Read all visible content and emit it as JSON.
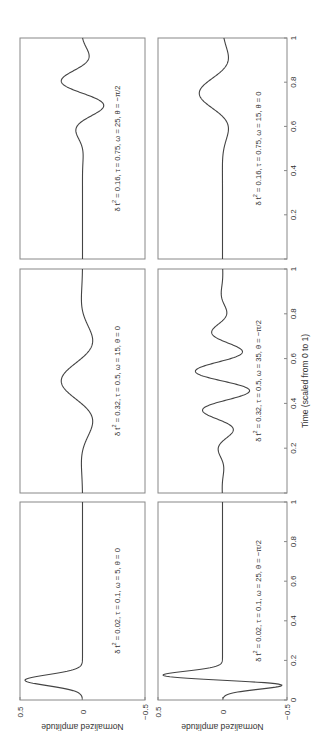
{
  "figure": {
    "orientation": "rotated-90-ccw",
    "line_color": "#444444",
    "frame_color": "#888888",
    "xlabel": "Time (scaled from 0 to 1)",
    "ylabel": "Normalized amplitude"
  },
  "chart_data": [
    {
      "type": "line",
      "panel": "row1-col1",
      "title": "δ t² = 0.02, τ = 0.1, ω = 5, θ = 0",
      "params": {
        "dt2": 0.02,
        "tau": 0.1,
        "omega": 5,
        "theta": "0"
      },
      "xlabel": "",
      "ylabel": "Normalized amplitude",
      "xlim": [
        0,
        1
      ],
      "ylim": [
        -0.5,
        0.5
      ],
      "xticks": [],
      "yticks": [
        "0.5",
        "0",
        "-0.5"
      ],
      "description": "single positive spike of ~0.45 at t≈0.1, flat at 0 elsewhere"
    },
    {
      "type": "line",
      "panel": "row1-col2",
      "title": "δ t² = 0.32, τ = 0.5, ω = 15, θ = 0",
      "params": {
        "dt2": 0.32,
        "tau": 0.5,
        "omega": 15,
        "theta": "0"
      },
      "xlabel": "",
      "ylabel": "",
      "xlim": [
        0,
        1
      ],
      "ylim": [
        -0.5,
        0.5
      ],
      "xticks": [],
      "yticks": [],
      "description": "smooth oscillation centered at t=0.5, peak ≈ 0.15, troughs ≈ -0.1 near t≈0.3 and 0.7"
    },
    {
      "type": "line",
      "panel": "row1-col3",
      "title": "δ t² = 0.16, τ = 0.75, ω = 25, θ = −π/2",
      "params": {
        "dt2": 0.16,
        "tau": 0.75,
        "omega": 25,
        "theta": "-π/2"
      },
      "xlabel": "",
      "ylabel": "",
      "xlim": [
        0,
        1
      ],
      "ylim": [
        -0.5,
        0.5
      ],
      "xticks": [],
      "yticks": [],
      "description": "flat until t≈0.5, then sine-like oscillation: trough ≈ -0.15 at t≈0.66, peak ≈ +0.15 at t≈0.84"
    },
    {
      "type": "line",
      "panel": "row2-col1",
      "title": "δ t² = 0.02, τ = 0.1, ω = 25, θ = −π/2",
      "params": {
        "dt2": 0.02,
        "tau": 0.1,
        "omega": 25,
        "theta": "-π/2"
      },
      "xlabel": "",
      "ylabel": "Normalized amplitude",
      "xlim": [
        0,
        1
      ],
      "ylim": [
        -0.5,
        0.5
      ],
      "xticks": [
        "0",
        "0.2",
        "0.4",
        "0.6",
        "0.8",
        "1"
      ],
      "yticks": [
        "0.5",
        "0",
        "-0.5"
      ],
      "description": "biphasic spike: negative ≈ -0.35 at t≈0.07, positive ≈ +0.42 at t≈0.12, flat after"
    },
    {
      "type": "line",
      "panel": "row2-col2",
      "title": "δ t² = 0.32, τ = 0.5, ω = 35, θ = −π/2",
      "params": {
        "dt2": 0.32,
        "tau": 0.5,
        "omega": 35,
        "theta": "-π/2"
      },
      "xlabel": "Time (scaled from 0 to 1)",
      "ylabel": "",
      "xlim": [
        0,
        1
      ],
      "ylim": [
        -0.5,
        0.5
      ],
      "xticks": [
        "0",
        "0.2",
        "0.4",
        "0.6",
        "0.8",
        "1"
      ],
      "yticks": [],
      "description": "windowed sine oscillation centered at t=0.5, ~5 cycles, peak amplitude ≈ 0.2"
    },
    {
      "type": "line",
      "panel": "row2-col3",
      "title": "δ t² = 0.16, τ = 0.75, ω = 15, θ = 0",
      "params": {
        "dt2": 0.16,
        "tau": 0.75,
        "omega": 15,
        "theta": "0"
      },
      "xlabel": "",
      "ylabel": "",
      "xlim": [
        0,
        1
      ],
      "ylim": [
        -0.5,
        0.5
      ],
      "xticks": [
        "0",
        "0.2",
        "0.4",
        "0.6",
        "0.8",
        "1"
      ],
      "yticks": [],
      "description": "flat until t≈0.5, dip ≈ -0.05 at t≈0.58, peak ≈ +0.18 at t≈0.75, dip ≈ -0.05 at t≈0.92"
    }
  ],
  "panels": [
    {
      "col": 0,
      "row": 0,
      "tau": 0.1,
      "omega": 5,
      "theta": 0,
      "width": 0.028,
      "amp": 0.46,
      "label_main": "δ t",
      "label_rest": " = 0.02, τ = 0.1, ω = 5, θ = 0"
    },
    {
      "col": 1,
      "row": 0,
      "tau": 0.5,
      "omega": 15,
      "theta": 0,
      "width": 0.16,
      "amp": 0.17,
      "label_main": "δ t",
      "label_rest": " = 0.32, τ = 0.5, ω = 15, θ = 0"
    },
    {
      "col": 2,
      "row": 0,
      "tau": 0.75,
      "omega": 25,
      "theta": -1.5708,
      "width": 0.11,
      "amp": 0.17,
      "label_main": "δ t",
      "label_rest": " = 0.16, τ = 0.75, ω = 25, θ = −π/2"
    },
    {
      "col": 0,
      "row": 1,
      "tau": 0.1,
      "omega": 25,
      "theta": -1.5708,
      "width": 0.028,
      "amp": 0.46,
      "label_main": "δ t",
      "label_rest": " = 0.02, τ = 0.1, ω = 25, θ = −π/2"
    },
    {
      "col": 1,
      "row": 1,
      "tau": 0.5,
      "omega": 35,
      "theta": -1.5708,
      "width": 0.16,
      "amp": 0.21,
      "label_main": "δ t",
      "label_rest": " = 0.32, τ = 0.5, ω = 35, θ = −π/2"
    },
    {
      "col": 2,
      "row": 1,
      "tau": 0.75,
      "omega": 15,
      "theta": 0,
      "width": 0.11,
      "amp": 0.18,
      "label_main": "δ t",
      "label_rest": " = 0.16, τ = 0.75, ω = 15, θ = 0"
    }
  ],
  "ticks": {
    "time": [
      "0",
      "0.2",
      "0.4",
      "0.6",
      "0.8",
      "1"
    ],
    "amplitude": [
      "0.5",
      "0",
      "−0.5"
    ]
  }
}
